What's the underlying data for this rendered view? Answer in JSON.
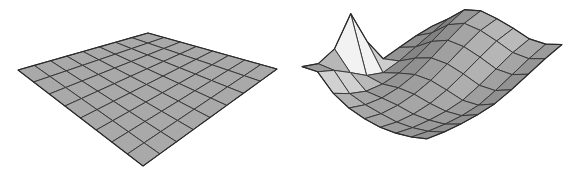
{
  "figure": {
    "title": "",
    "width": 584,
    "height": 173,
    "background": "#ffffff",
    "panel_count": 2
  },
  "style": {
    "surface_fill_base": "#a9a9a9",
    "surface_fill_light": "#f2f2f2",
    "surface_fill_dark": "#6e6e6e",
    "edge_color": "#3a3a3a",
    "edge_width": 1.0,
    "silhouette_color": "#2b2b2b",
    "silhouette_width": 1.2
  },
  "panels": [
    {
      "name": "undeformed-grid",
      "label": "",
      "type": "surface-mesh",
      "grid": {
        "nx": 8,
        "ny": 8
      },
      "description": "flat square grid plate in perspective, uniform gray fill",
      "projection": {
        "corner_left": [
          18,
          70
        ],
        "corner_top": [
          148,
          33
        ],
        "corner_right": [
          277,
          69
        ],
        "corner_bottom": [
          143,
          166
        ]
      },
      "heights": [
        [
          0,
          0,
          0,
          0,
          0,
          0,
          0,
          0,
          0
        ],
        [
          0,
          0,
          0,
          0,
          0,
          0,
          0,
          0,
          0
        ],
        [
          0,
          0,
          0,
          0,
          0,
          0,
          0,
          0,
          0
        ],
        [
          0,
          0,
          0,
          0,
          0,
          0,
          0,
          0,
          0
        ],
        [
          0,
          0,
          0,
          0,
          0,
          0,
          0,
          0,
          0
        ],
        [
          0,
          0,
          0,
          0,
          0,
          0,
          0,
          0,
          0
        ],
        [
          0,
          0,
          0,
          0,
          0,
          0,
          0,
          0,
          0
        ],
        [
          0,
          0,
          0,
          0,
          0,
          0,
          0,
          0,
          0
        ],
        [
          0,
          0,
          0,
          0,
          0,
          0,
          0,
          0,
          0
        ]
      ]
    },
    {
      "name": "deformed-grid",
      "label": "",
      "type": "surface-mesh",
      "grid": {
        "nx": 8,
        "ny": 8
      },
      "description": "warped surface: tall sharp peak at left, broad hump across back-center, upturned right edge, sagging bowl through the middle-front",
      "projection": {
        "corner_left": [
          10,
          70
        ],
        "corner_top": [
          140,
          33
        ],
        "corner_right": [
          270,
          69
        ],
        "corner_bottom": [
          135,
          166
        ]
      },
      "heights": [
        [
          0.2,
          0.55,
          0.95,
          1.05,
          0.95,
          0.8,
          0.62,
          0.6,
          0.72
        ],
        [
          0.05,
          0.3,
          0.7,
          0.9,
          0.85,
          0.7,
          0.52,
          0.5,
          0.66
        ],
        [
          -0.15,
          0.05,
          0.4,
          0.62,
          0.62,
          0.5,
          0.34,
          0.36,
          0.56
        ],
        [
          -0.35,
          -0.2,
          0.1,
          0.32,
          0.36,
          0.28,
          0.16,
          0.22,
          0.46
        ],
        [
          0.3,
          -0.38,
          -0.15,
          0.05,
          0.12,
          0.08,
          0.02,
          0.12,
          0.4
        ],
        [
          1.25,
          -0.3,
          -0.28,
          -0.12,
          -0.04,
          -0.04,
          0.0,
          0.14,
          0.44
        ],
        [
          0.35,
          -0.05,
          -0.3,
          -0.2,
          -0.12,
          -0.08,
          0.04,
          0.22,
          0.52
        ],
        [
          0.05,
          0.18,
          -0.18,
          -0.18,
          -0.12,
          -0.04,
          0.12,
          0.34,
          0.64
        ],
        [
          0.1,
          0.3,
          0.02,
          -0.06,
          -0.02,
          0.08,
          0.26,
          0.5,
          0.8
        ]
      ]
    }
  ]
}
